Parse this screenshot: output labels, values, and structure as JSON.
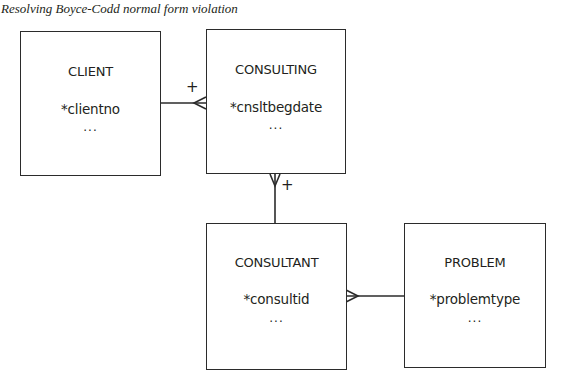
{
  "title": "Resolving Boyce-Codd normal form violation",
  "colors": {
    "line": "#2b2b2b",
    "text": "#231f20",
    "background": "#ffffff"
  },
  "entities": {
    "client": {
      "name": "CLIENT",
      "key": "*clientno",
      "more": "..."
    },
    "consulting": {
      "name": "CONSULTING",
      "key": "*cnsltbegdate",
      "more": "..."
    },
    "consultant": {
      "name": "CONSULTANT",
      "key": "*consultid",
      "more": "..."
    },
    "problem": {
      "name": "PROBLEM",
      "key": "*problemtype",
      "more": "..."
    }
  },
  "relationships": [
    {
      "from": "CLIENT",
      "to": "CONSULTING",
      "from_end": "one",
      "to_end": "many",
      "label": "+"
    },
    {
      "from": "CONSULTANT",
      "to": "CONSULTING",
      "from_end": "one",
      "to_end": "many",
      "label": "+"
    },
    {
      "from": "PROBLEM",
      "to": "CONSULTANT",
      "from_end": "one",
      "to_end": "many",
      "label": ""
    }
  ],
  "markers": {
    "client_consulting_plus": "+",
    "consultant_consulting_plus": "+"
  }
}
